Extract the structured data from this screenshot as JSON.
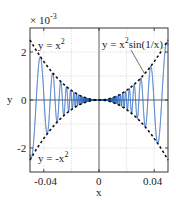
{
  "chart_data": {
    "type": "line",
    "title": "",
    "xlabel": "x",
    "ylabel": "y",
    "y_multiplier": "× 10",
    "y_multiplier_exp": "-3",
    "xlim": [
      -0.05,
      0.05
    ],
    "ylim": [
      -0.003,
      0.003
    ],
    "grid": true,
    "grid_style": "dotted",
    "x_ticks": [
      -0.04,
      0,
      0.04
    ],
    "x_tick_labels": [
      "-0.04",
      "0",
      "0.04"
    ],
    "x_minor_grid": [
      -0.02,
      0.02
    ],
    "y_ticks": [
      -0.002,
      0,
      0.002
    ],
    "y_tick_labels": [
      "-2",
      "0",
      "2"
    ],
    "y_minor_grid": [
      -0.001,
      0.001
    ],
    "series": [
      {
        "name": "y = x²sin(1/x)",
        "style": "solid",
        "color": "#1f5fbf",
        "function": "x^2*sin(1/x)"
      },
      {
        "name": "y = x²",
        "style": "dashed",
        "color": "#111111",
        "function": "x^2"
      },
      {
        "name": "y = -x²",
        "style": "dashed",
        "color": "#111111",
        "function": "-x^2"
      }
    ],
    "annotations": [
      {
        "text": "y = x²",
        "x": -0.046,
        "y": 0.0024
      },
      {
        "text": "y = x²sin(1/x)",
        "x": 0.0,
        "y": 0.0024,
        "arrow_to": [
          0.033,
          0.0011
        ]
      },
      {
        "text": "y = -x²",
        "x": -0.046,
        "y": -0.0026
      }
    ]
  },
  "labels": {
    "ann_upper": "y = x",
    "ann_upper_sup": "2",
    "ann_main_pre": "y = x",
    "ann_main_sup": "2",
    "ann_main_post": "sin(1/x)",
    "ann_lower": "y = -x",
    "ann_lower_sup": "2",
    "xlabel": "x",
    "ylabel": "y",
    "mult": "× 10",
    "mult_exp": "-3",
    "xt0": "-0.04",
    "xt1": "0",
    "xt2": "0.04",
    "yt0": "2",
    "yt1": "0",
    "yt2": "-2"
  }
}
